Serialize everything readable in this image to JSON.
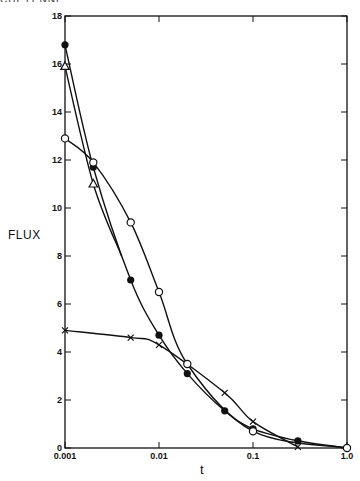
{
  "page": {
    "cutoff_header": "CHEYENNE PLATEAU"
  },
  "chart_data": {
    "type": "line",
    "title": "",
    "xlabel": "t",
    "ylabel": "FLUX",
    "xscale": "log",
    "xlim": [
      0.001,
      1.0
    ],
    "ylim": [
      0,
      18
    ],
    "grid": false,
    "legend": null,
    "x_ticks": [
      {
        "value": 0.001,
        "label": "0.001"
      },
      {
        "value": 0.01,
        "label": "0.01"
      },
      {
        "value": 0.1,
        "label": "0.1"
      },
      {
        "value": 1.0,
        "label": "1.0"
      }
    ],
    "y_ticks": [
      {
        "value": 0,
        "label": "0"
      },
      {
        "value": 2,
        "label": "2"
      },
      {
        "value": 4,
        "label": "4"
      },
      {
        "value": 6,
        "label": "6"
      },
      {
        "value": 8,
        "label": "8"
      },
      {
        "value": 10,
        "label": "10"
      },
      {
        "value": 12,
        "label": "12"
      },
      {
        "value": 14,
        "label": "14"
      },
      {
        "value": 16,
        "label": "16"
      },
      {
        "value": 18,
        "label": "18"
      }
    ],
    "series": [
      {
        "name": "filled-circle",
        "marker": "filled-circle",
        "points": [
          [
            0.001,
            16.8
          ],
          [
            0.002,
            11.7
          ],
          [
            0.005,
            7.0
          ],
          [
            0.01,
            4.7
          ],
          [
            0.02,
            3.1
          ],
          [
            0.05,
            1.55
          ],
          [
            0.1,
            0.8
          ],
          [
            0.3,
            0.3
          ],
          [
            1.0,
            0.0
          ]
        ]
      },
      {
        "name": "open-circle",
        "marker": "open-circle",
        "points": [
          [
            0.001,
            12.9
          ],
          [
            0.002,
            11.9
          ],
          [
            0.005,
            9.4
          ],
          [
            0.01,
            6.5
          ],
          [
            0.02,
            3.5
          ],
          [
            0.1,
            0.7
          ],
          [
            1.0,
            0.0
          ]
        ]
      },
      {
        "name": "triangle",
        "marker": "open-triangle",
        "points": [
          [
            0.001,
            15.9
          ],
          [
            0.002,
            11.0
          ],
          [
            0.004,
            8.0
          ]
        ]
      },
      {
        "name": "cross",
        "marker": "x",
        "points": [
          [
            0.001,
            4.9
          ],
          [
            0.005,
            4.6
          ],
          [
            0.01,
            4.3
          ],
          [
            0.05,
            2.3
          ],
          [
            0.1,
            1.1
          ],
          [
            0.3,
            0.05
          ]
        ]
      }
    ]
  }
}
